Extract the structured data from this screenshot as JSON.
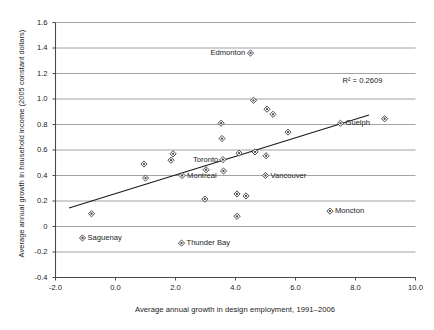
{
  "chart_data": {
    "type": "scatter",
    "title": "",
    "xlabel": "Average annual growth in design employment, 1991–2006",
    "ylabel": "Average annual growth in household income (2005 constant dollars)",
    "xlim": [
      -2.0,
      10.0
    ],
    "ylim": [
      -0.4,
      1.6
    ],
    "xticks": [
      "-2.0",
      "0.0",
      "2.0",
      "4.0",
      "6.0",
      "8.0",
      "10.0"
    ],
    "xtick_values": [
      -2.0,
      0.0,
      2.0,
      4.0,
      6.0,
      8.0,
      10.0
    ],
    "yticks": [
      "1.6",
      "1.4",
      "1.2",
      "1.0",
      "0.8",
      "0.6",
      "0.4",
      "0.2",
      "0",
      "-0.2",
      "-0.4"
    ],
    "ytick_values": [
      1.6,
      1.4,
      1.2,
      1.0,
      0.8,
      0.6,
      0.4,
      0.2,
      0.0,
      -0.2,
      -0.4
    ],
    "grid": true,
    "grid_axis": "y",
    "legend": "none",
    "annotations": [
      {
        "text": "R² = 0.2609",
        "x": 8.9,
        "y": 1.14,
        "anchor": "end"
      }
    ],
    "trendline": {
      "type": "linear",
      "x_start": -1.55,
      "y_start": 0.145,
      "x_end": 8.45,
      "y_end": 0.875,
      "r_squared": 0.2609
    },
    "points": [
      {
        "label": "",
        "x": -1.1,
        "y": -0.09
      },
      {
        "label": "",
        "x": -0.8,
        "y": 0.1
      },
      {
        "label": "",
        "x": 0.95,
        "y": 0.49
      },
      {
        "label": "",
        "x": 1.0,
        "y": 0.38
      },
      {
        "label": "",
        "x": 1.85,
        "y": 0.52
      },
      {
        "label": "",
        "x": 1.92,
        "y": 0.57
      },
      {
        "label": "Montreal",
        "x": 2.22,
        "y": 0.4
      },
      {
        "label": "Thunder Bay",
        "x": 2.2,
        "y": -0.13
      },
      {
        "label": "",
        "x": 2.98,
        "y": 0.215
      },
      {
        "label": "",
        "x": 3.02,
        "y": 0.445
      },
      {
        "label": "",
        "x": 3.52,
        "y": 0.81
      },
      {
        "label": "",
        "x": 3.55,
        "y": 0.69
      },
      {
        "label": "Toronto",
        "x": 3.58,
        "y": 0.525
      },
      {
        "label": "",
        "x": 3.6,
        "y": 0.435
      },
      {
        "label": "",
        "x": 4.05,
        "y": 0.255
      },
      {
        "label": "",
        "x": 4.05,
        "y": 0.08
      },
      {
        "label": "",
        "x": 4.12,
        "y": 0.575
      },
      {
        "label": "",
        "x": 4.35,
        "y": 0.24
      },
      {
        "label": "Edmonton",
        "x": 4.5,
        "y": 1.36
      },
      {
        "label": "",
        "x": 4.6,
        "y": 0.99
      },
      {
        "label": "",
        "x": 4.65,
        "y": 0.585
      },
      {
        "label": "Vancouver",
        "x": 5.0,
        "y": 0.4
      },
      {
        "label": "",
        "x": 5.02,
        "y": 0.555
      },
      {
        "label": "",
        "x": 5.05,
        "y": 0.92
      },
      {
        "label": "",
        "x": 5.25,
        "y": 0.88
      },
      {
        "label": "",
        "x": 5.75,
        "y": 0.74
      },
      {
        "label": "Moncton",
        "x": 7.15,
        "y": 0.12
      },
      {
        "label": "Guelph",
        "x": 7.5,
        "y": 0.81
      },
      {
        "label": "",
        "x": 8.97,
        "y": 0.845
      }
    ],
    "point_labels": [
      {
        "name": "Edmonton",
        "x": 4.5,
        "y": 1.36,
        "position": "left"
      },
      {
        "name": "Guelph",
        "x": 7.5,
        "y": 0.81,
        "position": "right"
      },
      {
        "name": "Toronto",
        "x": 3.58,
        "y": 0.525,
        "position": "left"
      },
      {
        "name": "Vancouver",
        "x": 5.0,
        "y": 0.4,
        "position": "right"
      },
      {
        "name": "Montreal",
        "x": 2.22,
        "y": 0.4,
        "position": "right"
      },
      {
        "name": "Moncton",
        "x": 7.15,
        "y": 0.12,
        "position": "right"
      },
      {
        "name": "Saguenay",
        "x": -1.1,
        "y": -0.09,
        "position": "right"
      },
      {
        "name": "Thunder Bay",
        "x": 2.2,
        "y": -0.13,
        "position": "right"
      }
    ],
    "colors": {
      "marker_fill": "#ffffff",
      "marker_edge": "#3a3a3a",
      "gridline": "#8c8c8c",
      "axis": "#4a4a4a",
      "trendline": "#1a1a1a",
      "text": "#1a1a1a"
    }
  }
}
